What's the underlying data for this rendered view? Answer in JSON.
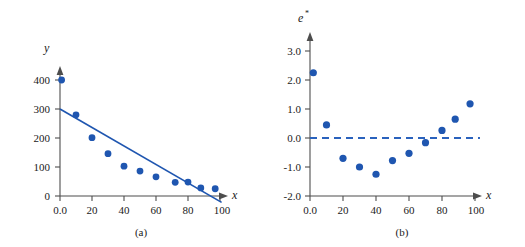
{
  "figure": {
    "panels": [
      {
        "id": "a",
        "caption": "(a)",
        "y_axis_label": "y",
        "x_axis_label": "x"
      },
      {
        "id": "b",
        "caption": "(b)",
        "y_axis_label": "e",
        "y_axis_label_sup": "*",
        "x_axis_label": "x"
      }
    ]
  },
  "chart_data": [
    {
      "type": "scatter",
      "panel": "(a)",
      "title": "",
      "xlabel": "x",
      "ylabel": "y",
      "xlim": [
        0,
        110
      ],
      "ylim": [
        -25,
        430
      ],
      "grid": false,
      "legend": "none",
      "xticks": [
        0,
        20,
        40,
        60,
        80,
        100
      ],
      "xtick_labels": [
        "0.0",
        "20",
        "40",
        "60",
        "80",
        "100"
      ],
      "yticks": [
        0,
        100,
        200,
        300,
        400
      ],
      "ytick_labels": [
        "0",
        "100",
        "200",
        "300",
        "400"
      ],
      "series": [
        {
          "name": "observations",
          "marker": "circle",
          "color": "#1f56b0",
          "points": [
            {
              "x": 1,
              "y": 400
            },
            {
              "x": 10,
              "y": 280
            },
            {
              "x": 20,
              "y": 201
            },
            {
              "x": 30,
              "y": 146
            },
            {
              "x": 40,
              "y": 103
            },
            {
              "x": 50,
              "y": 86
            },
            {
              "x": 60,
              "y": 66
            },
            {
              "x": 72,
              "y": 47
            },
            {
              "x": 80,
              "y": 48
            },
            {
              "x": 88,
              "y": 28
            },
            {
              "x": 97,
              "y": 25
            }
          ]
        },
        {
          "name": "fitted-regression-line",
          "type": "line",
          "color": "#1f56b0",
          "endpoints": [
            {
              "x": 0,
              "y": 300
            },
            {
              "x": 101,
              "y": -22
            }
          ]
        }
      ]
    },
    {
      "type": "scatter",
      "panel": "(b)",
      "title": "",
      "xlabel": "x",
      "ylabel": "e*",
      "xlim": [
        0,
        110
      ],
      "ylim": [
        -2.0,
        3.5
      ],
      "grid": false,
      "legend": "none",
      "xticks": [
        0,
        20,
        40,
        60,
        80,
        100
      ],
      "xtick_labels": [
        "0.0",
        "20",
        "40",
        "60",
        "80",
        "100"
      ],
      "yticks": [
        -2.0,
        -1.0,
        0.0,
        1.0,
        2.0,
        3.0
      ],
      "ytick_labels": [
        "-2.0",
        "-1.0",
        "0.0",
        "1.0",
        "2.0",
        "3.0"
      ],
      "reference_line": {
        "name": "zero-line",
        "y": 0.0,
        "style": "dashed",
        "color": "#2a62bd"
      },
      "series": [
        {
          "name": "standardized-residuals",
          "marker": "circle",
          "color": "#1f56b0",
          "points": [
            {
              "x": 2,
              "y": 2.25
            },
            {
              "x": 10,
              "y": 0.45
            },
            {
              "x": 20,
              "y": -0.7
            },
            {
              "x": 30,
              "y": -1.0
            },
            {
              "x": 40,
              "y": -1.25
            },
            {
              "x": 50,
              "y": -0.78
            },
            {
              "x": 60,
              "y": -0.53
            },
            {
              "x": 70,
              "y": -0.16
            },
            {
              "x": 80,
              "y": 0.26
            },
            {
              "x": 88,
              "y": 0.65
            },
            {
              "x": 97,
              "y": 1.18
            }
          ]
        }
      ]
    }
  ]
}
